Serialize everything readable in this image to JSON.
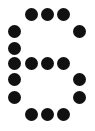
{
  "glyph": {
    "character": "6",
    "dot_color": "#111111",
    "background_color": "#ffffff",
    "columns": 5,
    "rows": 7,
    "col_x": [
      14,
      31,
      47,
      63,
      79
    ],
    "row_y": [
      14,
      31,
      48,
      63,
      79,
      97,
      114
    ],
    "pattern": [
      "01110",
      "10001",
      "10000",
      "11110",
      "10001",
      "10001",
      "01110"
    ]
  }
}
